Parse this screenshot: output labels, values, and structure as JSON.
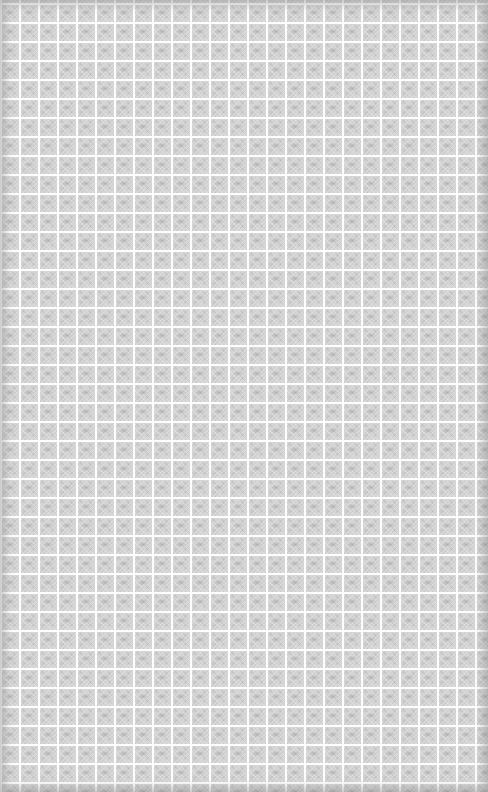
{
  "background": {
    "pattern": "tiled-grid-texture",
    "base_color": "#d6d6d6",
    "grid_line_color": "#ffffff",
    "tile_size_px": 19,
    "edge_vignette_color": "#8c8c8c"
  }
}
